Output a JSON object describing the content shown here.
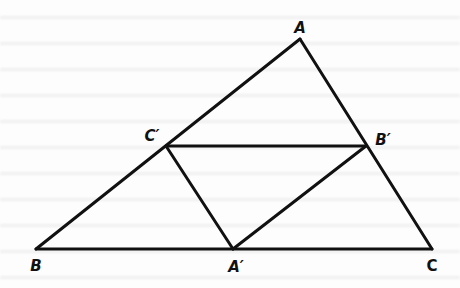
{
  "figure": {
    "type": "triangle-midpoint-diagram",
    "line_color": "#111111",
    "background_color": "#ffffff",
    "stroke_width": 3,
    "points": {
      "A": {
        "x": 300,
        "y": 39,
        "label": "A",
        "label_x": 300,
        "label_y": 28
      },
      "B": {
        "x": 36,
        "y": 249,
        "label": "B",
        "label_x": 36,
        "label_y": 266
      },
      "C": {
        "x": 432,
        "y": 249,
        "label": "C",
        "label_x": 432,
        "label_y": 266
      },
      "A_prime": {
        "x": 233,
        "y": 249,
        "label": "A′",
        "label_x": 236,
        "label_y": 267
      },
      "B_prime": {
        "x": 366,
        "y": 146,
        "label": "B′",
        "label_x": 383,
        "label_y": 140
      },
      "C_prime": {
        "x": 166,
        "y": 146,
        "label": "C′",
        "label_x": 152,
        "label_y": 136
      }
    },
    "segments": [
      {
        "from": "A",
        "to": "B"
      },
      {
        "from": "A",
        "to": "C"
      },
      {
        "from": "B",
        "to": "C"
      },
      {
        "from": "C_prime",
        "to": "B_prime"
      },
      {
        "from": "C_prime",
        "to": "A_prime"
      },
      {
        "from": "B_prime",
        "to": "A_prime"
      }
    ]
  }
}
